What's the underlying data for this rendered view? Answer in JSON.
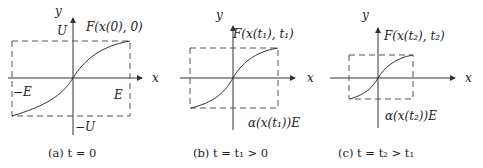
{
  "panels": [
    {
      "id": "a",
      "y_label": "y",
      "x_label": "x",
      "func_label": "F(x(0), 0)",
      "upper_label": "U",
      "lower_label": "−U",
      "left_label": "−E",
      "right_label": "E",
      "caption": "(a) t = 0"
    },
    {
      "id": "b",
      "y_label": "y",
      "x_label": "x",
      "func_label": "F(x(t₁), t₁)",
      "bound_label": "α(x(t₁))E",
      "caption": "(b) t = t₁ > 0"
    },
    {
      "id": "c",
      "y_label": "y",
      "x_label": "x",
      "func_label": "F(x(t₂), t₂)",
      "bound_label": "α(x(t₂))E",
      "caption": "(c) t = t₂ > t₁"
    }
  ]
}
